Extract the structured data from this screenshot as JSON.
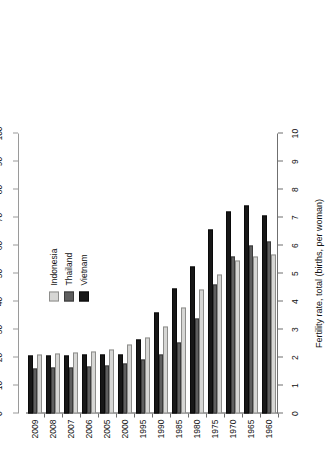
{
  "chart_data": {
    "type": "bar",
    "orientation": "horizontal-rotated",
    "title": "",
    "xlabel": "Fertility rate, total (births, per woman)",
    "ylabel": "",
    "secondary_axis_label": "% of population",
    "categories": [
      "1960",
      "1965",
      "1970",
      "1975",
      "1980",
      "1985",
      "1990",
      "1995",
      "2000",
      "2005",
      "2006",
      "2007",
      "2008",
      "2009"
    ],
    "value_axis": {
      "label": "Fertility rate, total (births, per woman)",
      "ticks": [
        "0",
        "1",
        "2",
        "3",
        "4",
        "5",
        "6",
        "7",
        "8",
        "9",
        "10"
      ],
      "min": 0,
      "max": 10,
      "grid": false
    },
    "secondary_value_axis": {
      "label": "% of population",
      "ticks": [
        "0",
        "10",
        "20",
        "30",
        "40",
        "50",
        "60",
        "70",
        "80",
        "90",
        "100"
      ],
      "min": 0,
      "max": 100,
      "grid": false
    },
    "legend": {
      "position": "upper-right",
      "entries": [
        {
          "name": "Indonesia",
          "color": "#d6d6d4"
        },
        {
          "name": "Thailand",
          "color": "#5f5f5f"
        },
        {
          "name": "Vietnam",
          "color": "#171717"
        }
      ]
    },
    "series": [
      {
        "name": "Indonesia",
        "color": "#d6d6d4",
        "values": [
          5.67,
          5.62,
          5.47,
          4.95,
          4.43,
          3.77,
          3.11,
          2.73,
          2.48,
          2.3,
          2.23,
          2.18,
          2.13,
          2.1
        ]
      },
      {
        "name": "Thailand",
        "color": "#5f5f5f",
        "values": [
          6.14,
          5.99,
          5.6,
          4.6,
          3.39,
          2.55,
          2.09,
          1.92,
          1.8,
          1.7,
          1.67,
          1.65,
          1.63,
          1.61
        ]
      },
      {
        "name": "Vietnam",
        "color": "#171717",
        "values": [
          7.08,
          7.43,
          7.22,
          6.57,
          5.25,
          4.48,
          3.62,
          2.64,
          2.11,
          2.1,
          2.09,
          2.08,
          2.07,
          2.06
        ]
      }
    ]
  },
  "legend": {
    "items": [
      {
        "label": "Indonesia"
      },
      {
        "label": "Thailand"
      },
      {
        "label": "Vietnam"
      }
    ]
  },
  "axes": {
    "fertility_title": "Fertility rate, total (births, per woman)",
    "population_title": "% of population"
  }
}
